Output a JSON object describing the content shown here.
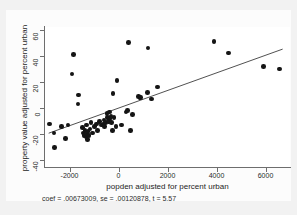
{
  "figure": {
    "caption": "coef = .00673009, se = .00120878, t = 5.57"
  },
  "chart_data": {
    "type": "scatter",
    "title": "",
    "subtitle": "",
    "xlabel": "popden adjusted for percent urban",
    "ylabel": "property value adjusted for percent urban",
    "xlim": [
      -3000,
      7000
    ],
    "ylim": [
      -45,
      62
    ],
    "xticks": [
      -2000,
      0,
      2000,
      4000,
      6000
    ],
    "xtick_labels": [
      "-2000",
      "0",
      "2000",
      "4000",
      "6000"
    ],
    "yticks": [
      -40,
      -20,
      0,
      20,
      40,
      60
    ],
    "ytick_labels": [
      "-40",
      "-20",
      "0",
      "20",
      "40",
      "60"
    ],
    "grid": false,
    "legend": null,
    "annotations": [
      "coef = .00673009, se = .00120878, t = 5.57"
    ],
    "fit": {
      "type": "linear",
      "coef": 0.00673009,
      "se": 0.00120878,
      "t": 5.57,
      "intercept": 0,
      "x_start": -2850,
      "x_end": 6700
    },
    "points": [
      {
        "x": -2820,
        "y": -12
      },
      {
        "x": -2640,
        "y": -19
      },
      {
        "x": -2620,
        "y": -30
      },
      {
        "x": -2320,
        "y": -14
      },
      {
        "x": -2170,
        "y": -23
      },
      {
        "x": -2060,
        "y": -13
      },
      {
        "x": -1900,
        "y": 26
      },
      {
        "x": -1840,
        "y": 41
      },
      {
        "x": -1640,
        "y": 10
      },
      {
        "x": -1660,
        "y": 3
      },
      {
        "x": -1480,
        "y": -15
      },
      {
        "x": -1430,
        "y": -19
      },
      {
        "x": -1400,
        "y": -21
      },
      {
        "x": -1360,
        "y": -17
      },
      {
        "x": -1330,
        "y": -22
      },
      {
        "x": -1310,
        "y": -13
      },
      {
        "x": -1290,
        "y": -20
      },
      {
        "x": -1270,
        "y": -24
      },
      {
        "x": -1240,
        "y": -18
      },
      {
        "x": -1200,
        "y": -21
      },
      {
        "x": -1160,
        "y": -16
      },
      {
        "x": -1120,
        "y": -11
      },
      {
        "x": -1050,
        "y": -19
      },
      {
        "x": -980,
        "y": -14
      },
      {
        "x": -900,
        "y": -12
      },
      {
        "x": -860,
        "y": -17
      },
      {
        "x": -780,
        "y": -10
      },
      {
        "x": -700,
        "y": -13
      },
      {
        "x": -640,
        "y": -12
      },
      {
        "x": -600,
        "y": -9
      },
      {
        "x": -560,
        "y": -14
      },
      {
        "x": -520,
        "y": -11
      },
      {
        "x": -470,
        "y": -4
      },
      {
        "x": -440,
        "y": -7
      },
      {
        "x": -400,
        "y": -10
      },
      {
        "x": -360,
        "y": -3
      },
      {
        "x": -340,
        "y": -8
      },
      {
        "x": -310,
        "y": -6
      },
      {
        "x": -290,
        "y": -11
      },
      {
        "x": -250,
        "y": -17
      },
      {
        "x": -230,
        "y": 11
      },
      {
        "x": -180,
        "y": -7
      },
      {
        "x": -100,
        "y": -14
      },
      {
        "x": -60,
        "y": 21
      },
      {
        "x": 120,
        "y": -13
      },
      {
        "x": 300,
        "y": -3
      },
      {
        "x": 360,
        "y": -2
      },
      {
        "x": 420,
        "y": 50
      },
      {
        "x": 480,
        "y": -17
      },
      {
        "x": 560,
        "y": -5
      },
      {
        "x": 820,
        "y": 9
      },
      {
        "x": 870,
        "y": 8
      },
      {
        "x": 900,
        "y": 8
      },
      {
        "x": 1180,
        "y": 12
      },
      {
        "x": 1210,
        "y": 46
      },
      {
        "x": 1350,
        "y": 7
      },
      {
        "x": 1600,
        "y": 16
      },
      {
        "x": 3900,
        "y": 51
      },
      {
        "x": 4480,
        "y": 42
      },
      {
        "x": 5930,
        "y": 32
      },
      {
        "x": 6560,
        "y": 30
      }
    ]
  }
}
